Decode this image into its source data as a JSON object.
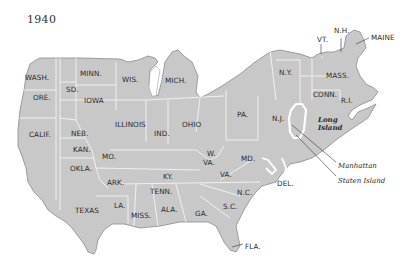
{
  "title": "1940",
  "colors": {
    "land": "#c8c8c8",
    "border": "#f4f4f4",
    "outline": "#8a8a8a",
    "water": "#ffffff",
    "text": "#2a2a2a"
  },
  "states": [
    {
      "id": "wash",
      "label": "WASH.",
      "x": 25,
      "y": 74
    },
    {
      "id": "ore",
      "label": "ORE.",
      "x": 33,
      "y": 94
    },
    {
      "id": "calif",
      "label": "CALIF.",
      "x": 29,
      "y": 131
    },
    {
      "id": "sd",
      "label": "SD.",
      "x": 66,
      "y": 86
    },
    {
      "id": "minn",
      "label": "MINN.",
      "x": 80,
      "y": 70
    },
    {
      "id": "iowa",
      "label": "IOWA",
      "x": 84,
      "y": 97
    },
    {
      "id": "wis",
      "label": "WIS.",
      "x": 122,
      "y": 76
    },
    {
      "id": "mich",
      "label": "MICH.",
      "x": 165,
      "y": 77
    },
    {
      "id": "illinois",
      "label": "ILLINOIS",
      "x": 115,
      "y": 121
    },
    {
      "id": "ind",
      "label": "IND.",
      "x": 154,
      "y": 130
    },
    {
      "id": "ohio",
      "label": "OHIO",
      "x": 182,
      "y": 121
    },
    {
      "id": "neb",
      "label": "NEB.",
      "x": 71,
      "y": 130
    },
    {
      "id": "kan",
      "label": "KAN.",
      "x": 73,
      "y": 146
    },
    {
      "id": "mo",
      "label": "MO.",
      "x": 102,
      "y": 153
    },
    {
      "id": "okla",
      "label": "OKLA.",
      "x": 70,
      "y": 165
    },
    {
      "id": "ark",
      "label": "ARK.",
      "x": 107,
      "y": 179
    },
    {
      "id": "texas",
      "label": "TEXAS",
      "x": 75,
      "y": 207
    },
    {
      "id": "la",
      "label": "LA.",
      "x": 114,
      "y": 202
    },
    {
      "id": "miss",
      "label": "MISS.",
      "x": 131,
      "y": 212
    },
    {
      "id": "ala",
      "label": "ALA.",
      "x": 161,
      "y": 206
    },
    {
      "id": "ga",
      "label": "GA.",
      "x": 195,
      "y": 210
    },
    {
      "id": "sc",
      "label": "S.C.",
      "x": 223,
      "y": 203
    },
    {
      "id": "nc",
      "label": "N.C.",
      "x": 237,
      "y": 189
    },
    {
      "id": "tenn",
      "label": "TENN.",
      "x": 150,
      "y": 188
    },
    {
      "id": "ky",
      "label": "KY.",
      "x": 163,
      "y": 173
    },
    {
      "id": "w-va",
      "label": "W.",
      "x": 207,
      "y": 150
    },
    {
      "id": "w-va2",
      "label": "VA.",
      "x": 203,
      "y": 159
    },
    {
      "id": "va",
      "label": "VA.",
      "x": 220,
      "y": 171
    },
    {
      "id": "md",
      "label": "MD.",
      "x": 241,
      "y": 155
    },
    {
      "id": "del",
      "label": "DEL.",
      "x": 277,
      "y": 180
    },
    {
      "id": "pa",
      "label": "PA.",
      "x": 237,
      "y": 111
    },
    {
      "id": "nj",
      "label": "N.J.",
      "x": 272,
      "y": 115
    },
    {
      "id": "ny",
      "label": "N.Y.",
      "x": 279,
      "y": 69
    },
    {
      "id": "mass",
      "label": "MASS.",
      "x": 326,
      "y": 72
    },
    {
      "id": "conn",
      "label": "CONN.",
      "x": 313,
      "y": 91
    },
    {
      "id": "ri",
      "label": "R.I.",
      "x": 341,
      "y": 97
    },
    {
      "id": "vt",
      "label": "VT.",
      "x": 317,
      "y": 36
    },
    {
      "id": "nh",
      "label": "N.H.",
      "x": 334,
      "y": 27
    },
    {
      "id": "maine",
      "label": "MAINE",
      "x": 371,
      "y": 34
    },
    {
      "id": "fla",
      "label": "FLA.",
      "x": 245,
      "y": 243
    }
  ],
  "features": [
    {
      "id": "long-island",
      "line1": "Long",
      "line2": "Island",
      "x": 318,
      "y": 116
    },
    {
      "id": "manhattan",
      "label": "Manhattan",
      "x": 338,
      "y": 162
    },
    {
      "id": "staten-island",
      "label": "Staten Island",
      "x": 338,
      "y": 177
    }
  ]
}
